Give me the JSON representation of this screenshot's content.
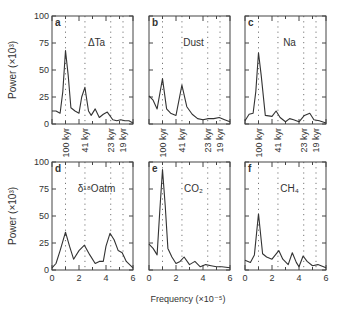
{
  "chart_data": {
    "type": "line",
    "layout": "2x3 panels",
    "xlabel": "Frequency (×10⁻⁵)",
    "ylabel": "Power (×10³)",
    "xlim": [
      0,
      6
    ],
    "ylim": [
      0,
      100
    ],
    "yticks": [
      0,
      25,
      50,
      75,
      100
    ],
    "xticks": [
      0,
      2,
      4,
      6
    ],
    "period_lines": [
      {
        "label": "100 kyr",
        "freq": 1.0
      },
      {
        "label": "41 kyr",
        "freq": 2.44
      },
      {
        "label": "23 kyr",
        "freq": 4.35
      },
      {
        "label": "19 kyr",
        "freq": 5.26
      }
    ],
    "panels": [
      {
        "id": "a",
        "title": "ΔTa",
        "x": [
          0,
          0.3,
          0.6,
          0.8,
          1.0,
          1.2,
          1.4,
          1.7,
          2.0,
          2.2,
          2.44,
          2.7,
          2.9,
          3.2,
          3.5,
          3.8,
          4.1,
          4.5,
          4.8,
          5.1,
          5.4,
          5.7,
          6.0
        ],
        "y": [
          12,
          12,
          10,
          30,
          68,
          45,
          15,
          12,
          10,
          25,
          34,
          12,
          8,
          14,
          6,
          9,
          11,
          4,
          3,
          4,
          3,
          3,
          1
        ]
      },
      {
        "id": "b",
        "title": "Dust",
        "x": [
          0,
          0.3,
          0.6,
          1.0,
          1.3,
          1.6,
          2.0,
          2.44,
          2.8,
          3.2,
          3.6,
          4.0,
          4.4,
          4.8,
          5.2,
          5.6,
          6.0
        ],
        "y": [
          26,
          22,
          14,
          42,
          14,
          10,
          8,
          36,
          16,
          9,
          5,
          4,
          5,
          5,
          6,
          4,
          2
        ]
      },
      {
        "id": "c",
        "title": "Na",
        "x": [
          0,
          0.3,
          0.6,
          0.8,
          1.0,
          1.2,
          1.5,
          2.0,
          2.3,
          2.6,
          3.0,
          3.3,
          3.6,
          4.0,
          4.4,
          4.8,
          5.1,
          5.5,
          6.0
        ],
        "y": [
          3,
          9,
          10,
          30,
          66,
          45,
          8,
          7,
          12,
          6,
          2,
          5,
          4,
          2,
          8,
          10,
          4,
          3,
          1
        ]
      },
      {
        "id": "d",
        "title": "δ¹⁸Oatm",
        "x": [
          0,
          0.3,
          0.6,
          1.0,
          1.3,
          1.6,
          2.0,
          2.4,
          2.8,
          3.2,
          3.5,
          3.8,
          4.0,
          4.3,
          4.6,
          4.9,
          5.2,
          5.5,
          6.0
        ],
        "y": [
          2,
          6,
          18,
          35,
          22,
          10,
          18,
          23,
          14,
          6,
          8,
          8,
          22,
          34,
          28,
          18,
          16,
          8,
          2
        ]
      },
      {
        "id": "e",
        "title": "CO₂",
        "x": [
          0,
          0.3,
          0.6,
          0.8,
          1.0,
          1.2,
          1.4,
          1.7,
          2.0,
          2.3,
          2.6,
          3.0,
          3.4,
          3.8,
          4.2,
          4.6,
          5.0,
          5.4,
          6.0
        ],
        "y": [
          24,
          20,
          14,
          55,
          93,
          60,
          20,
          12,
          6,
          8,
          12,
          5,
          8,
          3,
          5,
          4,
          3,
          3,
          2
        ]
      },
      {
        "id": "f",
        "title": "CH₄",
        "x": [
          0,
          0.4,
          0.7,
          1.0,
          1.3,
          1.6,
          2.0,
          2.5,
          2.8,
          3.2,
          3.5,
          3.8,
          4.0,
          4.3,
          4.6,
          5.0,
          5.4,
          6.0
        ],
        "y": [
          9,
          7,
          14,
          52,
          15,
          12,
          10,
          18,
          10,
          5,
          16,
          7,
          3,
          13,
          8,
          4,
          5,
          2
        ]
      }
    ]
  }
}
